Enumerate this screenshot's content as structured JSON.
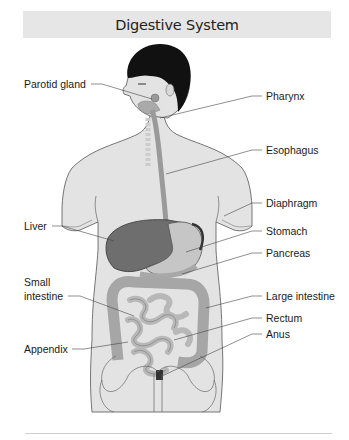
{
  "header": {
    "title": "Digestive System"
  },
  "diagram": {
    "labels_left": [
      {
        "id": "parotid-gland",
        "text": "Parotid gland"
      },
      {
        "id": "liver",
        "text": "Liver"
      },
      {
        "id": "small-intestine-1",
        "text": "Small"
      },
      {
        "id": "small-intestine-2",
        "text": "intestine"
      },
      {
        "id": "appendix",
        "text": "Appendix"
      }
    ],
    "labels_right": [
      {
        "id": "pharynx",
        "text": "Pharynx"
      },
      {
        "id": "esophagus",
        "text": "Esophagus"
      },
      {
        "id": "diaphragm",
        "text": "Diaphragm"
      },
      {
        "id": "stomach",
        "text": "Stomach"
      },
      {
        "id": "pancreas",
        "text": "Pancreas"
      },
      {
        "id": "large-intestine",
        "text": "Large intestine"
      },
      {
        "id": "rectum",
        "text": "Rectum"
      },
      {
        "id": "anus",
        "text": "Anus"
      }
    ]
  },
  "colors": {
    "title_bar": "#e6e6e6",
    "skin": "#e3e3e3",
    "hair": "#111111",
    "liver": "#6e6e6e",
    "organ": "#b9b9b9",
    "leader_line": "#444444"
  }
}
